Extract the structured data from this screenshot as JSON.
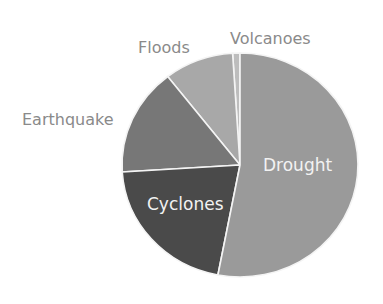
{
  "chart_data": {
    "type": "pie",
    "title": "",
    "categories": [
      "Drought",
      "Cyclones",
      "Earthquake",
      "Floods",
      "Volcanoes"
    ],
    "values": [
      53,
      21,
      15.5,
      9.5,
      1
    ],
    "unit": "percent (estimated)",
    "colors": [
      "#9a9a9a",
      "#4a4a4a",
      "#777777",
      "#a8a8a8",
      "#bdbdbd"
    ],
    "start_angle_deg": 0,
    "direction": "counterclockwise-from-top for Volcanoes, Floods, Earthquake, Cyclones; Drought fills right side",
    "legend": "none (direct labels)",
    "labels": {
      "drought": "Drought",
      "cyclones": "Cyclones",
      "earthquake": "Earthquake",
      "floods": "Floods",
      "volcanoes": "Volcanoes"
    }
  }
}
